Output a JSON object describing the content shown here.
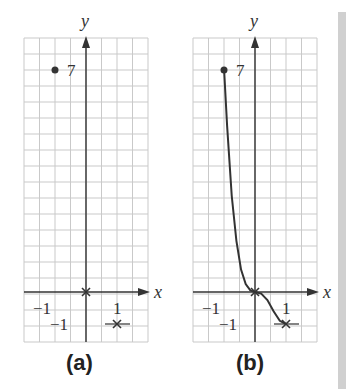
{
  "chart_data": [
    {
      "type": "scatter",
      "panel": "a",
      "caption": "(a)",
      "xlabel": "x",
      "ylabel": "y",
      "xlim": [
        -2,
        2
      ],
      "ylim": [
        -1.5,
        7.9
      ],
      "grid": true,
      "grid_step_x": 0.5,
      "grid_step_y": 0.5,
      "tick_labels": {
        "x": [
          "−1",
          "1"
        ],
        "y": [
          "7",
          "−1"
        ]
      },
      "points": [
        {
          "x": -1,
          "y": 7,
          "marker": "dot",
          "label": "7"
        },
        {
          "x": 0,
          "y": 0,
          "marker": "x"
        },
        {
          "x": 1,
          "y": -1,
          "marker": "x"
        }
      ]
    },
    {
      "type": "line",
      "panel": "b",
      "caption": "(b)",
      "xlabel": "x",
      "ylabel": "y",
      "xlim": [
        -2,
        2
      ],
      "ylim": [
        -1.5,
        7.9
      ],
      "grid": true,
      "grid_step_x": 0.5,
      "grid_step_y": 0.5,
      "tick_labels": {
        "x": [
          "−1",
          "1"
        ],
        "y": [
          "7",
          "−1"
        ]
      },
      "points": [
        {
          "x": -1,
          "y": 7,
          "marker": "dot",
          "label": "7"
        },
        {
          "x": 0,
          "y": 0,
          "marker": "x"
        },
        {
          "x": 1,
          "y": -1,
          "marker": "x"
        }
      ],
      "curve": [
        {
          "x": -1,
          "y": 7
        },
        {
          "x": -0.9,
          "y": 5.2
        },
        {
          "x": -0.75,
          "y": 3.0
        },
        {
          "x": -0.6,
          "y": 1.6
        },
        {
          "x": -0.45,
          "y": 0.7
        },
        {
          "x": -0.3,
          "y": 0.25
        },
        {
          "x": -0.15,
          "y": 0.05
        },
        {
          "x": 0,
          "y": 0
        },
        {
          "x": 0.2,
          "y": -0.05
        },
        {
          "x": 0.4,
          "y": -0.25
        },
        {
          "x": 0.6,
          "y": -0.6
        },
        {
          "x": 0.8,
          "y": -0.9
        },
        {
          "x": 1,
          "y": -1
        }
      ]
    }
  ],
  "captions": {
    "a": "(a)",
    "b": "(b)"
  },
  "labels": {
    "x": "x",
    "y": "y",
    "seven": "7",
    "neg_one": "−1",
    "one": "1"
  }
}
